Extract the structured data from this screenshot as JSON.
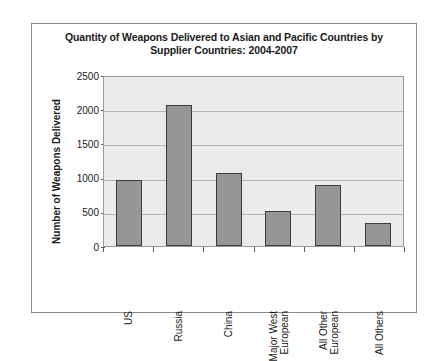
{
  "chart_data": {
    "type": "bar",
    "title": "Quantity of Weapons Delivered to Asian and Pacific Countries by Supplier Countries: 2004-2007",
    "title_line1": "Quantity of Weapons Delivered to Asian and Pacific Countries by",
    "title_line2": "Supplier Countries: 2004-2007",
    "xlabel": "",
    "ylabel": "Number of Weapons Delivered",
    "ylim": [
      0,
      2500
    ],
    "ytick_values": [
      0,
      500,
      1000,
      1500,
      2000,
      2500
    ],
    "ytick_labels": [
      "0",
      "500",
      "1000",
      "1500",
      "2000",
      "2500"
    ],
    "grid": true,
    "legend": false,
    "categories": [
      "US",
      "Russia",
      "China",
      "Major West European",
      "All Other European",
      "All Others"
    ],
    "category_lines": [
      [
        "US"
      ],
      [
        "Russia"
      ],
      [
        "China"
      ],
      [
        "Major West",
        "European"
      ],
      [
        "All Other",
        "European"
      ],
      [
        "All Others"
      ]
    ],
    "values": [
      970,
      2060,
      1060,
      510,
      890,
      340
    ],
    "bar_color": "#969696",
    "bar_border_color": "#3c3c3c",
    "plot_background": "#ebebeb",
    "gridline_color": "#b4b4b4"
  }
}
